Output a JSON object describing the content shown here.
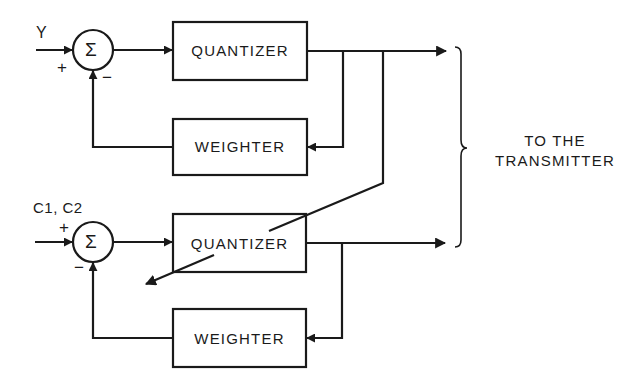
{
  "diagram": {
    "type": "block-diagram",
    "stroke_color": "#1a1a1a",
    "background": "#ffffff",
    "top_branch": {
      "input_label": "Y",
      "summer": {
        "symbol": "Σ",
        "plus_sign": "+",
        "minus_sign": "−"
      },
      "quantizer_label": "QUANTIZER",
      "weighter_label": "WEIGHTER"
    },
    "bottom_branch": {
      "input_label": "C1, C2",
      "summer": {
        "symbol": "Σ",
        "plus_sign": "+",
        "minus_sign": "−"
      },
      "quantizer_label": "QUANTIZER",
      "weighter_label": "WEIGHTER"
    },
    "destination": {
      "line1": "TO THE",
      "line2": "TRANSMITTER"
    }
  }
}
